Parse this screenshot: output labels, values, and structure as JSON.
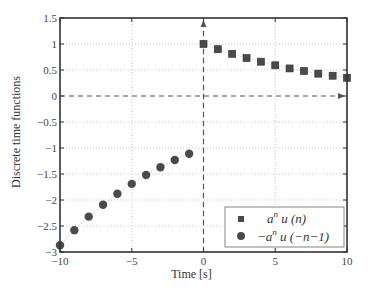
{
  "chart_data": {
    "type": "scatter",
    "title": "",
    "xlabel": "Time [s]",
    "ylabel": "Discrete time functions",
    "xlim": [
      -10,
      10
    ],
    "ylim": [
      -3,
      1.5
    ],
    "xticks": [
      -10,
      -5,
      0,
      5,
      10
    ],
    "xtick_labels": [
      "−10",
      "−5",
      "0",
      "5",
      "10"
    ],
    "yticks": [
      -3,
      -2.5,
      -2,
      -1.5,
      -1,
      -0.5,
      0,
      0.5,
      1,
      1.5
    ],
    "ytick_labels": [
      "−3",
      "−2.5",
      "−2",
      "−1.5",
      "−1",
      "−0.5",
      "0",
      "0.5",
      "1",
      "1.5"
    ],
    "grid": true,
    "legend_position": "lower right",
    "annotations": [
      "dashed x-axis at y=0 with arrow",
      "dashed y-axis at x=0 with arrow"
    ],
    "series": [
      {
        "name": "a^n u(n)",
        "marker": "square",
        "x": [
          0,
          1,
          2,
          3,
          4,
          5,
          6,
          7,
          8,
          9,
          10
        ],
        "values": [
          1.0,
          0.9,
          0.81,
          0.73,
          0.66,
          0.59,
          0.53,
          0.48,
          0.43,
          0.39,
          0.35
        ]
      },
      {
        "name": "−a^n u(−n−1)",
        "marker": "circle",
        "x": [
          -10,
          -9,
          -8,
          -7,
          -6,
          -5,
          -4,
          -3,
          -2,
          -1
        ],
        "values": [
          -2.87,
          -2.58,
          -2.32,
          -2.09,
          -1.88,
          -1.69,
          -1.52,
          -1.37,
          -1.23,
          -1.11
        ]
      }
    ]
  },
  "legend": {
    "items": [
      {
        "base": "a",
        "sup": "n",
        "rest": " u (n)",
        "prefix": ""
      },
      {
        "base": "a",
        "sup": "n",
        "rest": " u (−n−1)",
        "prefix": "−"
      }
    ]
  },
  "colors": {
    "marker": "#4a4a4a",
    "axis": "#333333",
    "grid": "#bbbbbb",
    "dashed_axis": "#555555"
  }
}
